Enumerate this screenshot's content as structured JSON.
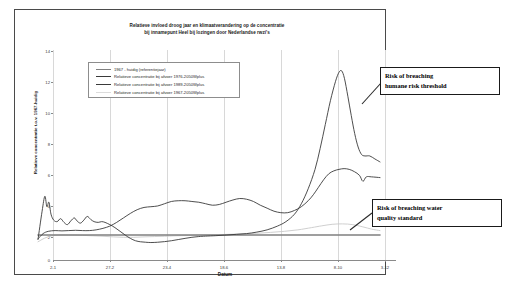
{
  "chart_data": {
    "type": "line",
    "title": "Relatieve invloed droog jaar en klimaatverandering op de concentratie bij innamepunt Heel bij lozingen door Nederlandse rwzi's",
    "title_line1": "Relatieve invloed droog jaar en klimaatverandering op de concentratie",
    "title_line2": "bij innamepunt Heel bij lozingen door Nederlandse rwzi's",
    "xlabel": "Datum",
    "ylabel": "Relatieve concentratie t.o.v. 1967-huidig",
    "ylim": [
      0,
      14
    ],
    "yticks": [
      0,
      2,
      4,
      6,
      8,
      10,
      12,
      14
    ],
    "xticks": [
      "2-1",
      "27-2",
      "23-4",
      "18-6",
      "13-8",
      "8-10",
      "3-12"
    ],
    "grid": "vertical",
    "legend_position": "upper-left-inside",
    "series": [
      {
        "name": "1967 - huidig (referentiejaar)",
        "color": "#808080",
        "width": 1.6,
        "points": [
          [
            0,
            1.0
          ],
          [
            10,
            1.0
          ],
          [
            20,
            1.0
          ],
          [
            30,
            1.0
          ],
          [
            40,
            1.0
          ],
          [
            50,
            1.0
          ],
          [
            60,
            1.0
          ],
          [
            70,
            1.0
          ],
          [
            80,
            1.0
          ],
          [
            90,
            1.0
          ],
          [
            100,
            1.0
          ]
        ]
      },
      {
        "name": "Relatieve concentratie bij afvoer 1976-2050Wplus",
        "color": "#3a3a3a",
        "width": 0.9,
        "points": [
          [
            0,
            0.7
          ],
          [
            1.2,
            2.6
          ],
          [
            2.0,
            3.6
          ],
          [
            2.6,
            2.9
          ],
          [
            3.2,
            3.2
          ],
          [
            3.8,
            2.4
          ],
          [
            4.6,
            2.0
          ],
          [
            5.6,
            1.9
          ],
          [
            6.6,
            2.1
          ],
          [
            7.6,
            1.85
          ],
          [
            8.6,
            1.7
          ],
          [
            9.6,
            1.95
          ],
          [
            10.6,
            2.15
          ],
          [
            11.4,
            1.95
          ],
          [
            12.4,
            1.8
          ],
          [
            13.4,
            2.0
          ],
          [
            14.4,
            2.25
          ],
          [
            15.4,
            2.05
          ],
          [
            16.4,
            1.9
          ],
          [
            17.6,
            1.85
          ],
          [
            18.6,
            1.9
          ],
          [
            19.6,
            1.85
          ],
          [
            21.0,
            1.7
          ],
          [
            22.5,
            1.5
          ],
          [
            24.0,
            1.25
          ],
          [
            25.5,
            1.0
          ],
          [
            27.0,
            0.78
          ],
          [
            28.5,
            0.62
          ],
          [
            30.0,
            0.55
          ],
          [
            31.5,
            0.52
          ],
          [
            33.0,
            0.5
          ],
          [
            35.0,
            0.52
          ],
          [
            37.0,
            0.56
          ],
          [
            39.0,
            0.62
          ],
          [
            41.0,
            0.7
          ],
          [
            43.0,
            0.78
          ],
          [
            45.0,
            0.85
          ],
          [
            47.0,
            0.9
          ],
          [
            49.0,
            0.93
          ],
          [
            52.0,
            0.96
          ],
          [
            55.0,
            1.0
          ],
          [
            58.0,
            1.05
          ],
          [
            61.0,
            1.1
          ],
          [
            64.0,
            1.2
          ],
          [
            67.0,
            1.35
          ],
          [
            70.0,
            1.6
          ],
          [
            72.5,
            1.9
          ],
          [
            75.0,
            2.4
          ],
          [
            77.0,
            3.1
          ],
          [
            79.0,
            4.1
          ],
          [
            81.0,
            5.4
          ],
          [
            82.5,
            6.8
          ],
          [
            84.0,
            8.4
          ],
          [
            85.5,
            10.0
          ],
          [
            87.0,
            11.3
          ],
          [
            88.0,
            11.9
          ],
          [
            88.8,
            12.0
          ],
          [
            89.6,
            11.5
          ],
          [
            90.6,
            10.3
          ],
          [
            91.6,
            9.0
          ],
          [
            92.6,
            7.8
          ],
          [
            93.6,
            6.9
          ],
          [
            94.6,
            6.4
          ],
          [
            95.6,
            6.3
          ],
          [
            97.0,
            6.3
          ],
          [
            98.5,
            6.1
          ],
          [
            100,
            5.9
          ]
        ]
      },
      {
        "name": "Relatieve concentratie bij afvoer 1989-2050Wplus",
        "color": "#3a3a3a",
        "width": 0.9,
        "points": [
          [
            0,
            0.75
          ],
          [
            1.5,
            1.1
          ],
          [
            3.0,
            1.25
          ],
          [
            5.0,
            1.3
          ],
          [
            7.0,
            1.28
          ],
          [
            9.0,
            1.3
          ],
          [
            11.0,
            1.32
          ],
          [
            13.0,
            1.3
          ],
          [
            15.0,
            1.3
          ],
          [
            17.0,
            1.35
          ],
          [
            19.0,
            1.45
          ],
          [
            21.0,
            1.6
          ],
          [
            23.0,
            1.85
          ],
          [
            25.0,
            2.15
          ],
          [
            27.0,
            2.45
          ],
          [
            29.0,
            2.7
          ],
          [
            31.0,
            2.85
          ],
          [
            33.0,
            2.9
          ],
          [
            35.0,
            2.95
          ],
          [
            37.0,
            3.1
          ],
          [
            39.0,
            3.25
          ],
          [
            41.0,
            3.3
          ],
          [
            43.0,
            3.3
          ],
          [
            45.0,
            3.25
          ],
          [
            47.0,
            3.2
          ],
          [
            49.0,
            3.1
          ],
          [
            51.0,
            3.0
          ],
          [
            53.0,
            3.05
          ],
          [
            55.0,
            3.2
          ],
          [
            57.0,
            3.35
          ],
          [
            59.0,
            3.45
          ],
          [
            61.0,
            3.4
          ],
          [
            63.0,
            3.25
          ],
          [
            65.0,
            3.0
          ],
          [
            67.0,
            2.8
          ],
          [
            69.0,
            2.6
          ],
          [
            71.0,
            2.5
          ],
          [
            73.0,
            2.5
          ],
          [
            75.0,
            2.65
          ],
          [
            77.0,
            2.9
          ],
          [
            79.0,
            3.3
          ],
          [
            80.5,
            3.7
          ],
          [
            82.0,
            4.2
          ],
          [
            83.5,
            4.7
          ],
          [
            85.0,
            5.1
          ],
          [
            86.5,
            5.3
          ],
          [
            88.0,
            5.4
          ],
          [
            89.5,
            5.45
          ],
          [
            91.0,
            5.4
          ],
          [
            92.5,
            5.25
          ],
          [
            94.0,
            5.0
          ],
          [
            95.0,
            4.6
          ],
          [
            96.0,
            4.9
          ],
          [
            97.5,
            4.9
          ],
          [
            100,
            4.85
          ]
        ]
      },
      {
        "name": "Relatieve concentratie bij afvoer 1967-2050Wplus",
        "color": "#c9c9c9",
        "width": 0.9,
        "points": [
          [
            0,
            0.55
          ],
          [
            2.0,
            0.8
          ],
          [
            4.0,
            0.95
          ],
          [
            6.0,
            1.0
          ],
          [
            8.0,
            1.0
          ],
          [
            10.0,
            1.0
          ],
          [
            13.0,
            0.98
          ],
          [
            16.0,
            0.95
          ],
          [
            19.0,
            0.92
          ],
          [
            22.0,
            0.88
          ],
          [
            25.0,
            0.85
          ],
          [
            28.0,
            0.85
          ],
          [
            31.0,
            0.88
          ],
          [
            34.0,
            0.9
          ],
          [
            37.0,
            0.92
          ],
          [
            40.0,
            0.95
          ],
          [
            44.0,
            0.97
          ],
          [
            48.0,
            1.0
          ],
          [
            52.0,
            1.02
          ],
          [
            56.0,
            1.05
          ],
          [
            60.0,
            1.08
          ],
          [
            64.0,
            1.12
          ],
          [
            68.0,
            1.18
          ],
          [
            72.0,
            1.25
          ],
          [
            76.0,
            1.35
          ],
          [
            80.0,
            1.5
          ],
          [
            83.0,
            1.62
          ],
          [
            86.0,
            1.72
          ],
          [
            89.0,
            1.75
          ],
          [
            92.0,
            1.7
          ],
          [
            95.0,
            1.55
          ],
          [
            97.5,
            1.4
          ],
          [
            100,
            1.3
          ]
        ]
      }
    ],
    "annotations": [
      {
        "id": "risk-human",
        "line1": "Risk of breaching",
        "line2": "humane risk threshold",
        "points_to": "main-peak"
      },
      {
        "id": "risk-water-quality",
        "line1": "Risk of breaching water",
        "line2": "quality standard",
        "points_to": "lower-curve"
      }
    ]
  }
}
